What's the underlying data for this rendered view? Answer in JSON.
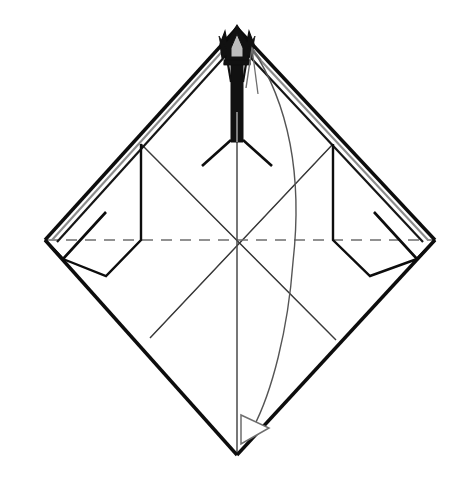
{
  "figure": {
    "kind": "origami-folding-diagram",
    "title": "",
    "background_color": "#ffffff",
    "canvas": {
      "width": 465,
      "height": 479
    }
  },
  "colors": {
    "outline": "#0d0d0d",
    "layer_edge_gray": "#8c8c8c",
    "crease_thin": "#555555",
    "fold_dashed": "#6e6e6e",
    "arrow_stroke": "#4a4a4a",
    "flap_fill": "#111111",
    "paper_fill": "#ffffff"
  },
  "geometry": {
    "top_vertex": {
      "x": 237,
      "y": 28
    },
    "left_vertex": {
      "x": 45,
      "y": 240
    },
    "right_vertex": {
      "x": 435,
      "y": 240
    },
    "bottom_vertex": {
      "x": 237,
      "y": 455
    },
    "center": {
      "x": 237,
      "y": 240
    },
    "flap_split_y": 140
  },
  "elements": {
    "outer_sheet": "square sheet rotated 45 degrees forming a diamond",
    "left_layer_edge": "doubled raw edge along upper-left side",
    "right_layer_edge": "doubled raw edge along upper-right side",
    "horizontal_fold": "dashed valley fold line across the middle",
    "vertical_center_crease": "vertical crease from apex to bottom point",
    "inner_creases": "four thin diagonal precreases forming a rotated inner square",
    "apex_flap": "narrow dark folded spike flap at the top apex",
    "apex_crown": "dark pointed crown of layered points at the very apex",
    "curved_arrow": "long curved fold arrow sweeping from apex down to the bottom point",
    "curved_arrow_head": "open hollow arrowhead at the bottom end of the curved arrow",
    "small_up_arrow": "thin hollow arrowhead pointing up near the apex"
  },
  "labels": {
    "step_number": "",
    "caption": ""
  }
}
